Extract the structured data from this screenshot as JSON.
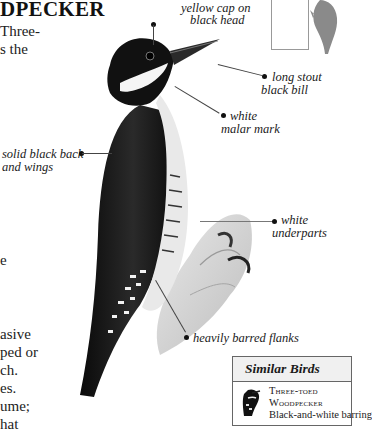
{
  "page": {
    "title_fragment": "DPECKER",
    "body_fragments_top": [
      "Three-",
      "s the"
    ],
    "body_fragments_mid": [
      "e"
    ],
    "body_fragments_bottom": [
      "asive",
      "ped or",
      "ch.",
      "es.",
      "ume;",
      "hat"
    ]
  },
  "illustration": {
    "subject": "Black-backed Woodpecker clinging to a branch",
    "labels": {
      "cap": [
        "yellow cap on",
        "black head"
      ],
      "bill": [
        "long stout",
        "black bill"
      ],
      "malar": [
        "white",
        "malar mark"
      ],
      "back": [
        "solid black back",
        "and wings"
      ],
      "underparts": [
        "white",
        "underparts"
      ],
      "flanks": "heavily barred flanks"
    }
  },
  "range_map": {
    "icon": "woodpecker-silhouette"
  },
  "similar_birds": {
    "header": "Similar Birds",
    "items": [
      {
        "name_line1": "Three-toed",
        "name_line2": "Woodpecker",
        "desc": "Black-and-white barring"
      }
    ]
  }
}
